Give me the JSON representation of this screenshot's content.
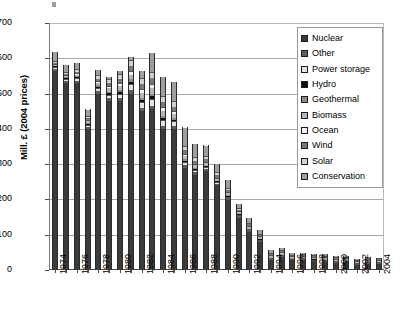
{
  "chart_data": {
    "type": "bar",
    "subtype": "stacked-vertical",
    "title": "",
    "subtitle": "",
    "xlabel": "",
    "ylabel": "Mill. £ (2004 prices)",
    "ylim": [
      0,
      700
    ],
    "ytick_step": 100,
    "yticks": [
      "0",
      "100",
      "200",
      "300",
      "400",
      "500",
      "600",
      "700"
    ],
    "grid": true,
    "grid_axis": "y",
    "legend_position": "top-right",
    "x": [
      1974,
      1975,
      1976,
      1977,
      1978,
      1979,
      1980,
      1981,
      1982,
      1983,
      1984,
      1985,
      1986,
      1987,
      1988,
      1989,
      1990,
      1991,
      1992,
      1993,
      1994,
      1995,
      1996,
      1997,
      1998,
      1999,
      2000,
      2001,
      2002,
      2003,
      2004
    ],
    "xtick_labels": [
      "1974",
      "1976",
      "1978",
      "1980",
      "1982",
      "1984",
      "1986",
      "1988",
      "1990",
      "1992",
      "1994",
      "1996",
      "1998",
      "2000",
      "2002",
      "2004"
    ],
    "categories": [
      "1974",
      "1975",
      "1976",
      "1977",
      "1978",
      "1979",
      "1980",
      "1981",
      "1982",
      "1983",
      "1984",
      "1985",
      "1986",
      "1987",
      "1988",
      "1989",
      "1990",
      "1991",
      "1992",
      "1993",
      "1994",
      "1995",
      "1996",
      "1997",
      "1998",
      "1999",
      "2000",
      "2001",
      "2002",
      "2003",
      "2004"
    ],
    "totals": [
      618,
      580,
      588,
      455,
      568,
      547,
      564,
      604,
      563,
      614,
      547,
      534,
      404,
      356,
      353,
      300,
      254,
      188,
      147,
      114,
      56,
      62,
      49,
      49,
      46,
      45,
      40,
      41,
      31,
      36,
      34
    ],
    "series": [
      {
        "name": "Nuclear",
        "color": "#3b3b3b",
        "values": [
          565,
          530,
          530,
          400,
          500,
          480,
          480,
          500,
          450,
          455,
          400,
          400,
          290,
          270,
          280,
          240,
          200,
          150,
          110,
          80,
          30,
          38,
          30,
          31,
          28,
          27,
          24,
          25,
          18,
          22,
          21
        ]
      },
      {
        "name": "Other",
        "color": "#5e5e5e",
        "values": [
          6,
          6,
          7,
          6,
          7,
          7,
          8,
          9,
          9,
          10,
          9,
          9,
          8,
          7,
          6,
          5,
          5,
          4,
          4,
          4,
          3,
          3,
          2,
          2,
          2,
          2,
          2,
          2,
          2,
          2,
          2
        ]
      },
      {
        "name": "Power storage",
        "color": "#e2e2e2",
        "values": [
          4,
          5,
          6,
          5,
          8,
          10,
          12,
          18,
          16,
          20,
          16,
          12,
          8,
          6,
          5,
          4,
          3,
          2,
          2,
          2,
          1,
          1,
          1,
          1,
          1,
          1,
          1,
          1,
          1,
          1,
          1
        ]
      },
      {
        "name": "Hydro",
        "color": "#0d0d0d",
        "values": [
          3,
          3,
          3,
          3,
          4,
          4,
          5,
          6,
          6,
          7,
          6,
          5,
          4,
          3,
          3,
          2,
          2,
          2,
          1,
          1,
          1,
          1,
          1,
          1,
          1,
          1,
          1,
          1,
          1,
          1,
          1
        ]
      },
      {
        "name": "Geothermal",
        "color": "#8c8c8c",
        "values": [
          2,
          2,
          3,
          3,
          4,
          5,
          6,
          7,
          7,
          8,
          6,
          5,
          4,
          3,
          2,
          2,
          2,
          1,
          1,
          1,
          1,
          1,
          1,
          1,
          1,
          1,
          1,
          1,
          0,
          1,
          1
        ]
      },
      {
        "name": "Biomass",
        "color": "#b5b5b5",
        "values": [
          3,
          4,
          5,
          5,
          7,
          9,
          11,
          14,
          14,
          16,
          14,
          12,
          10,
          8,
          7,
          6,
          6,
          5,
          5,
          5,
          4,
          4,
          3,
          3,
          3,
          3,
          3,
          3,
          2,
          3,
          3
        ]
      },
      {
        "name": "Ocean",
        "color": "#f2f2f2",
        "values": [
          2,
          3,
          4,
          4,
          6,
          7,
          9,
          11,
          11,
          12,
          10,
          8,
          6,
          4,
          3,
          3,
          2,
          2,
          2,
          2,
          1,
          1,
          1,
          1,
          1,
          1,
          1,
          1,
          1,
          1,
          1
        ]
      },
      {
        "name": "Wind",
        "color": "#787878",
        "values": [
          2,
          3,
          4,
          4,
          6,
          8,
          10,
          13,
          13,
          15,
          14,
          12,
          10,
          9,
          8,
          7,
          6,
          5,
          4,
          4,
          3,
          3,
          2,
          2,
          2,
          2,
          2,
          2,
          2,
          2,
          2
        ]
      },
      {
        "name": "Solar",
        "color": "#d0d0d0",
        "values": [
          4,
          6,
          8,
          8,
          10,
          12,
          14,
          16,
          17,
          19,
          17,
          15,
          12,
          10,
          9,
          8,
          7,
          6,
          5,
          4,
          3,
          3,
          2,
          2,
          2,
          2,
          1,
          1,
          1,
          1,
          1
        ]
      },
      {
        "name": "Conservation",
        "color": "#9e9e9e",
        "values": [
          27,
          18,
          18,
          17,
          16,
          5,
          9,
          10,
          20,
          52,
          55,
          56,
          52,
          36,
          30,
          23,
          21,
          11,
          13,
          11,
          9,
          7,
          6,
          5,
          5,
          5,
          4,
          4,
          3,
          2,
          1
        ]
      }
    ]
  }
}
